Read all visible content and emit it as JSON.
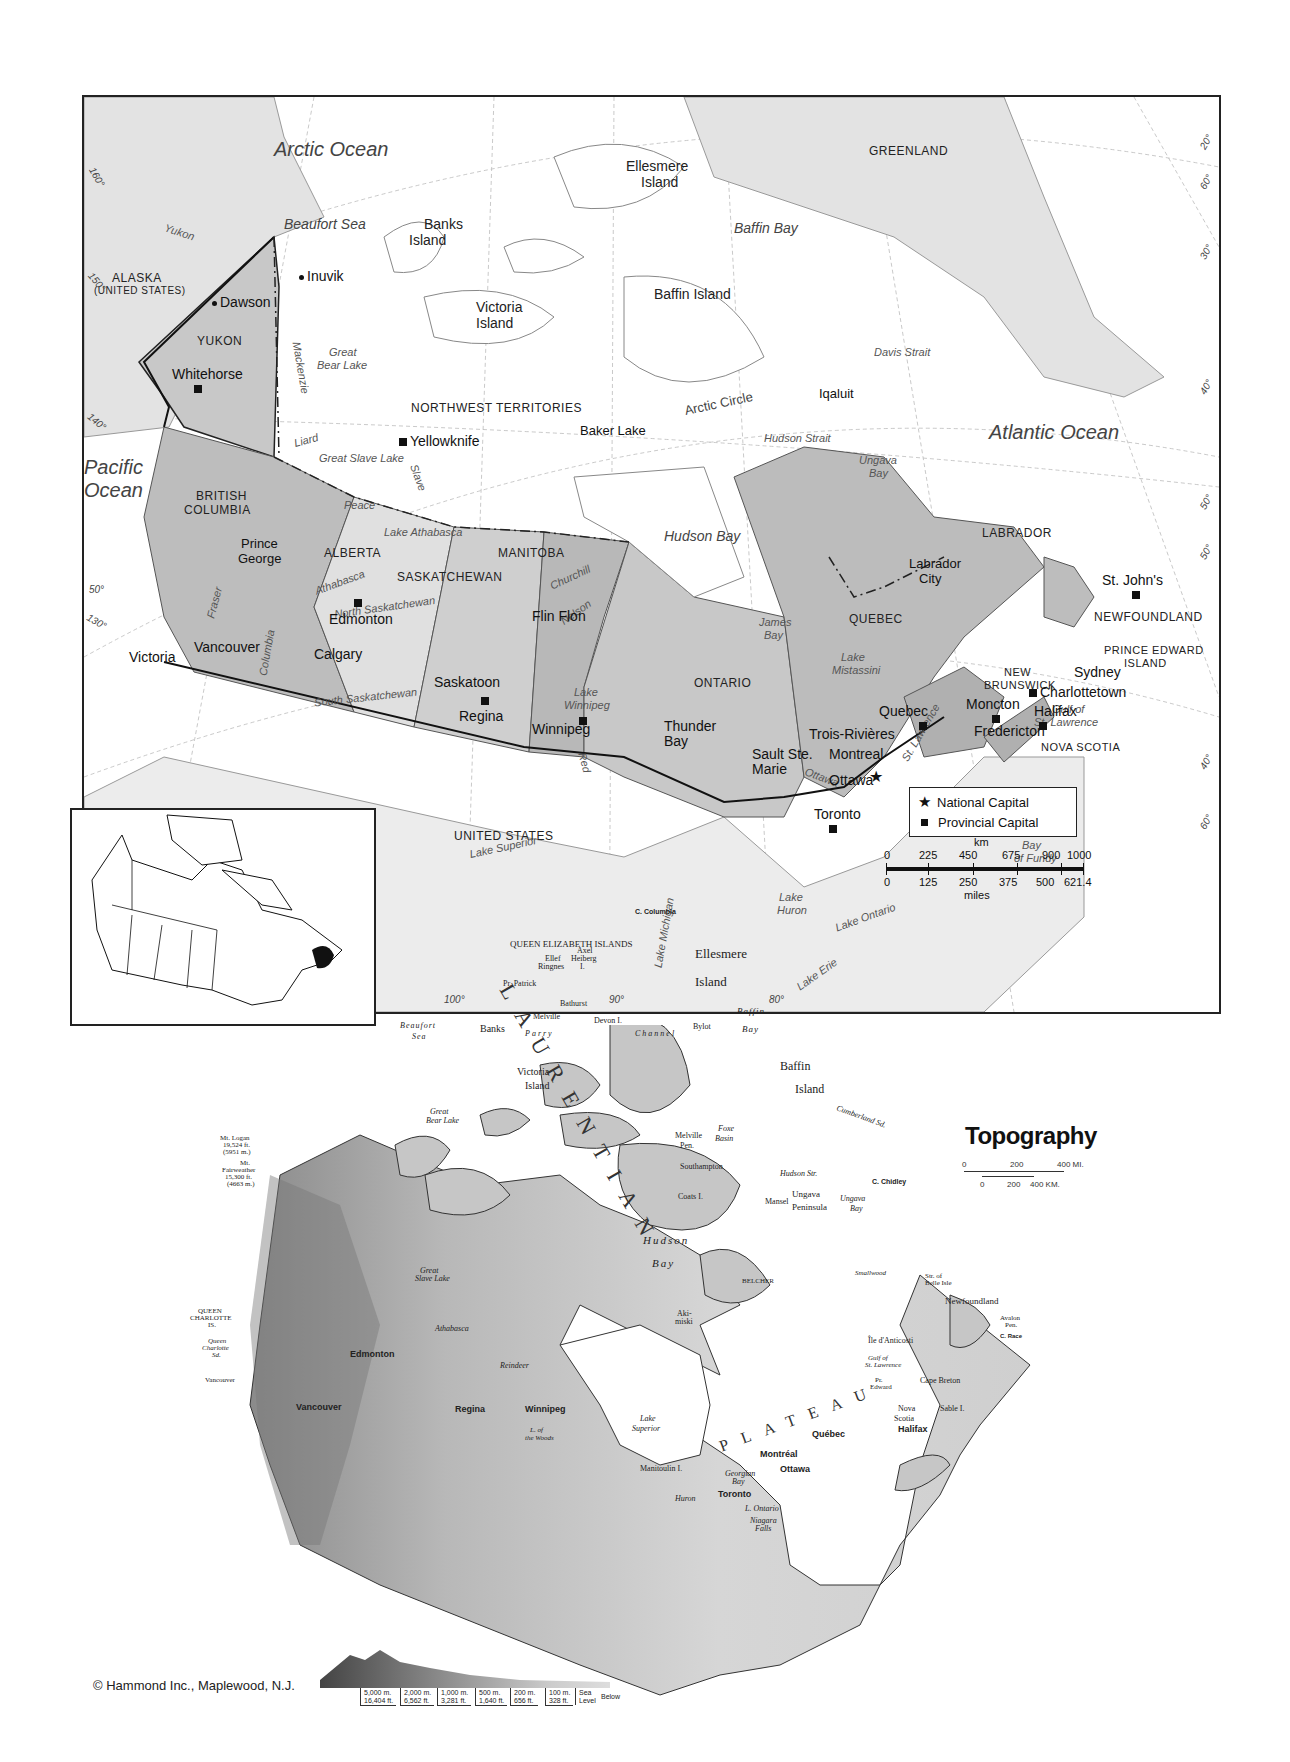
{
  "political_map": {
    "oceans": {
      "arctic": "Arctic Ocean",
      "atlantic": "Atlantic Ocean",
      "pacific_1": "Pacific",
      "pacific_2": "Ocean"
    },
    "water_bodies": {
      "beaufort_sea": "Beaufort Sea",
      "baffin_bay": "Baffin Bay",
      "davis_strait": "Davis Strait",
      "hudson_strait": "Hudson Strait",
      "hudson_bay": "Hudson Bay",
      "ungava_bay_1": "Ungava",
      "ungava_bay_2": "Bay",
      "james_bay_1": "James",
      "james_bay_2": "Bay",
      "great_bear_lake_1": "Great",
      "great_bear_lake_2": "Bear Lake",
      "great_slave_lake": "Great Slave Lake",
      "lake_athabasca": "Lake Athabasca",
      "lake_winnipeg_1": "Lake",
      "lake_winnipeg_2": "Winnipeg",
      "lake_mistassini_1": "Lake",
      "lake_mistassini_2": "Mistassini",
      "lake_superior": "Lake Superior",
      "lake_michigan": "Lake Michigan",
      "lake_huron_1": "Lake",
      "lake_huron_2": "Huron",
      "lake_ontario": "Lake Ontario",
      "lake_erie": "Lake Erie",
      "gulf_st_lawrence_1": "Gulf of",
      "gulf_st_lawrence_2": "St. Lawrence",
      "bay_of_fundy_1": "Bay",
      "bay_of_fundy_2": "of Fundy",
      "arctic_circle": "Arctic Circle"
    },
    "rivers": {
      "yukon": "Yukon",
      "mackenzie": "Mackenzie",
      "liard": "Liard",
      "slave": "Slave",
      "peace": "Peace",
      "athabasca": "Athabasca",
      "north_saskatchewan": "North Saskatchewan",
      "south_saskatchewan": "South Saskatchewan",
      "fraser": "Fraser",
      "columbia": "Columbia",
      "churchill": "Churchill",
      "nelson": "Nelson",
      "red": "Red",
      "ottawa": "Ottawa",
      "st_lawrence": "St. Lawrence"
    },
    "regions": {
      "alaska_1": "ALASKA",
      "alaska_2": "(UNITED STATES)",
      "yukon": "YUKON",
      "nwt": "NORTHWEST TERRITORIES",
      "bc_1": "BRITISH",
      "bc_2": "COLUMBIA",
      "alberta": "ALBERTA",
      "saskatchewan": "SASKATCHEWAN",
      "manitoba": "MANITOBA",
      "ontario": "ONTARIO",
      "quebec": "QUEBEC",
      "labrador": "LABRADOR",
      "newfoundland": "NEWFOUNDLAND",
      "pei_1": "PRINCE EDWARD",
      "pei_2": "ISLAND",
      "nb_1": "NEW",
      "nb_2": "BRUNSWICK",
      "nova_scotia": "NOVA SCOTIA",
      "greenland": "GREENLAND",
      "united_states": "UNITED STATES"
    },
    "islands": {
      "ellesmere_1": "Ellesmere",
      "ellesmere_2": "Island",
      "banks_1": "Banks",
      "banks_2": "Island",
      "victoria_1": "Victoria",
      "victoria_2": "Island",
      "baffin": "Baffin Island"
    },
    "cities": {
      "inuvik": "Inuvik",
      "dawson": "Dawson",
      "whitehorse": "Whitehorse",
      "yellowknife": "Yellowknife",
      "baker_lake": "Baker Lake",
      "iqaluit": "Iqaluit",
      "prince_george_1": "Prince",
      "prince_george_2": "George",
      "edmonton": "Edmonton",
      "calgary": "Calgary",
      "vancouver": "Vancouver",
      "victoria": "Victoria",
      "saskatoon": "Saskatoon",
      "regina": "Regina",
      "flin_flon": "Flin Flon",
      "winnipeg": "Winnipeg",
      "thunder_bay_1": "Thunder",
      "thunder_bay_2": "Bay",
      "sault_ste_marie_1": "Sault Ste.",
      "sault_ste_marie_2": "Marie",
      "toronto": "Toronto",
      "ottawa": "Ottawa",
      "montreal": "Montreal",
      "trois_rivieres": "Trois-Rivières",
      "quebec": "Quebec",
      "labrador_city_1": "Labrador",
      "labrador_city_2": "City",
      "st_johns": "St. John's",
      "sydney": "Sydney",
      "charlottetown": "Charlottetown",
      "moncton": "Moncton",
      "fredericton": "Fredericton",
      "halifax": "Halifax"
    },
    "graticule": {
      "lon_160": "160°",
      "lon_150": "150°",
      "lon_140": "140°",
      "lon_130": "130°",
      "lat_50_w": "50°",
      "lon_100": "100°",
      "lon_90": "90°",
      "lon_80": "80°",
      "e_20": "20°",
      "e_60a": "60°",
      "e_30": "30°",
      "e_40a": "40°",
      "e_50a": "50°",
      "e_50b": "50°",
      "e_40b": "40°",
      "e_60b": "60°"
    },
    "legend": {
      "national_capital": "National Capital",
      "provincial_capital": "Provincial Capital"
    },
    "scale": {
      "km_label": "km",
      "miles_label": "miles",
      "km_ticks": [
        "0",
        "225",
        "450",
        "675",
        "900",
        "1000"
      ],
      "mile_ticks": [
        "0",
        "125",
        "250",
        "375",
        "500",
        "621.4"
      ]
    }
  },
  "topography_map": {
    "title": "Topography",
    "scale": {
      "mi_ticks": [
        "0",
        "200",
        "400 MI."
      ],
      "km_ticks": [
        "0",
        "200",
        "400 KM."
      ]
    },
    "labels": {
      "c_columbia": "C. Columbia",
      "qe_islands": "QUEEN ELIZABETH ISLANDS",
      "ellesmere_1": "Ellesmere",
      "ellesmere_2": "Island",
      "axel_1": "Axel",
      "axel_2": "Heiberg",
      "axel_3": "I.",
      "ellef_1": "Ellef",
      "ellef_2": "Ringnes",
      "ellef_3": "I.",
      "pr_patrick_1": "Pr. Patrick",
      "pr_patrick_2": "I.",
      "bathurst_1": "Bathurst",
      "bathurst_2": "I.",
      "melville_1": "Melville",
      "melville_2": "I.",
      "devon": "Devon I.",
      "jones_sd": "Jones Sd.",
      "baffin_bay_1": "Baffin",
      "baffin_bay_2": "Bay",
      "bylot_1": "Bylot",
      "bylot_2": "I.",
      "beaufort_1": "Beaufort",
      "beaufort_2": "Sea",
      "banks_1": "Banks",
      "banks_2": "I.",
      "parry": "Parry",
      "channel": "Channel",
      "amundsen": "Amundsen Gulf",
      "victoria_1": "Victoria",
      "victoria_2": "Island",
      "pr_wales_1": "Pr.",
      "pr_wales_2": "of",
      "pr_wales_3": "Wales",
      "pr_wales_4": "I.",
      "somerset_1": "Somerset",
      "somerset_2": "I.",
      "boothia_1": "Boothia",
      "boothia_2": "Pen.",
      "g_boothia": "G. of Boothia",
      "baffin_isl_1": "Baffin",
      "baffin_isl_2": "Island",
      "great_bear_1": "Great",
      "great_bear_2": "Bear Lake",
      "cumberland": "Cumberland Sd.",
      "melville_pen_1": "Melville",
      "melville_pen_2": "Pen.",
      "foxe_basin_1": "Foxe",
      "foxe_basin_2": "Basin",
      "foxe_pen_1": "Foxe",
      "foxe_pen_2": "Pen.",
      "wager_1": "Wager",
      "wager_2": "Bay",
      "southampton_1": "Southampton",
      "southampton_2": "I.",
      "hudson_str": "Hudson Str.",
      "c_chidley": "C. Chidley",
      "coats": "Coats I.",
      "mansel_1": "Mansel",
      "mansel_2": "I.",
      "ungava_pen_1": "Ungava",
      "ungava_pen_2": "Peninsula",
      "ungava_bay_1": "Ungava",
      "ungava_bay_2": "Bay",
      "hudson_bay_1": "Hudson",
      "hudson_bay_2": "Bay",
      "belcher_1": "BELCHER",
      "belcher_2": "IS.",
      "mt_logan_1": "Mt. Logan",
      "mt_logan_2": "19,524 ft.",
      "mt_logan_3": "(5951 m.)",
      "mt_fairweather_1": "Mt.",
      "mt_fairweather_2": "Fairweather",
      "mt_fairweather_3": "15,300 ft.",
      "mt_fairweather_4": "(4663 m.)",
      "qc_islands_1": "QUEEN",
      "qc_islands_2": "CHARLOTTE",
      "qc_islands_3": "IS.",
      "qc_sound_1": "Queen",
      "qc_sound_2": "Charlotte",
      "qc_sound_3": "Sd.",
      "vancouver_i_1": "Vancouver",
      "vancouver_i_2": "I.",
      "great_slave_1": "Great",
      "great_slave_2": "Slave Lake",
      "hay": "Hay",
      "peace": "Peace",
      "athabasca_r": "Athabasca",
      "l_athabasca_1": "L.",
      "l_athabasca_2": "Athabasca",
      "reindeer_1": "Reindeer",
      "reindeer_2": "L.",
      "churchill": "Churchill",
      "nelson": "Nelson",
      "severn": "Severn",
      "smallwood_1": "Smallwood",
      "smallwood_2": "Res.",
      "str_belle_isle_1": "Str. of",
      "str_belle_isle_2": "Belle Isle",
      "newfoundland": "Newfoundland",
      "avalon_1": "Avalon",
      "avalon_2": "Pen.",
      "c_race": "C. Race",
      "anticosti": "Île d'Anticosti",
      "gulf_stl_1": "Gulf of",
      "gulf_stl_2": "St. Lawrence",
      "pr_edward_1": "Pr.",
      "pr_edward_2": "Edward",
      "pr_edward_3": "I.",
      "cape_breton_1": "Cape Breton",
      "cape_breton_2": "I.",
      "nova_scotia_1": "Nova",
      "nova_scotia_2": "Scotia",
      "sable": "Sable I.",
      "akimiski_1": "Aki-",
      "akimiski_2": "miski",
      "akimiski_3": "I.",
      "attawapiskat": "Attawapiskat",
      "albany": "Albany",
      "la_grande": "La Grande",
      "eastmain": "Eastmain",
      "mistassini": "L. Mistassini",
      "abitibi": "Abitibi",
      "winnipegosis_1": "L.",
      "winnipegosis_2": "Winnipegosis",
      "l_winnipeg_1": "L.",
      "l_winnipeg_2": "Winnipeg",
      "manitoba_1": "L.",
      "manitoba_2": "Manitoba",
      "l_woods_1": "L. of",
      "l_woods_2": "the Woods",
      "nipigon_1": "L.",
      "nipigon_2": "Nipigon",
      "lake_superior_1": "Lake",
      "lake_superior_2": "Superior",
      "manitoulin": "Manitoulin I.",
      "l_huron_1": "L.",
      "l_huron_2": "Huron",
      "georgian_1": "Georgian",
      "georgian_2": "Bay",
      "l_ontario": "L. Ontario",
      "niagara_1": "Niagara",
      "niagara_2": "Falls",
      "s_saskatchewan": "S. Saskatchewan",
      "n_saskatchewan": "N. Saskatchewan",
      "saskatchewan": "Saskatchewan",
      "ottawa_r": "Ottawa",
      "st_lawrence_r": "St. Lawrence",
      "coast_mts": "COAST MOUNTAINS",
      "rocky_mts": "ROCKY MOUNTAINS",
      "mackenzie_mts": "MACKENZIE MTS.",
      "laurentian": "LAURENTIAN",
      "plateau": "PLATEAU",
      "barren_grounds": "Barren Grounds",
      "edmonton": "Edmonton",
      "vancouver": "Vancouver",
      "regina": "Regina",
      "winnipeg": "Winnipeg",
      "toronto": "Toronto",
      "ottawa": "Ottawa",
      "montreal": "Montréal",
      "quebec": "Québec",
      "halifax": "Halifax"
    },
    "elevation_legend": [
      {
        "m": "5,000 m.",
        "ft": "16,404 ft."
      },
      {
        "m": "2,000 m.",
        "ft": "6,562 ft."
      },
      {
        "m": "1,000 m.",
        "ft": "3,281 ft."
      },
      {
        "m": "500 m.",
        "ft": "1,640 ft."
      },
      {
        "m": "200 m.",
        "ft": "656 ft."
      },
      {
        "m": "100 m.",
        "ft": "328 ft."
      },
      {
        "m": "Sea",
        "ft": "Level"
      },
      {
        "m": "",
        "ft": "Below"
      }
    ]
  },
  "copyright": "© Hammond Inc., Maplewood, N.J.",
  "colors": {
    "land_canada": "#c9c9c9",
    "province_dark": "#b5b5b5",
    "foreign_land": "#e6e6e6",
    "water": "#ffffff",
    "border": "#111111"
  }
}
